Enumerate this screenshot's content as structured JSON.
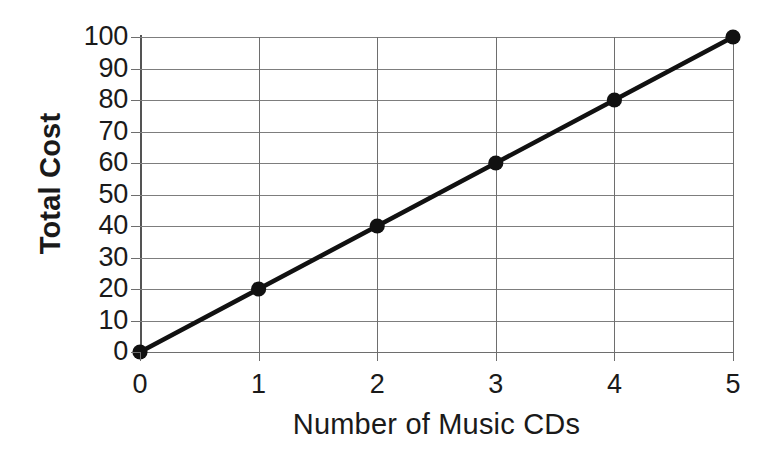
{
  "chart_data": {
    "type": "line",
    "title": "",
    "subtitle": "",
    "xlabel": "Number of Music CDs",
    "ylabel": "Total Cost",
    "x": [
      0,
      1,
      2,
      3,
      4,
      5
    ],
    "values": [
      0,
      20,
      40,
      60,
      80,
      100
    ],
    "series": [
      {
        "name": "Total Cost",
        "x": [
          0,
          1,
          2,
          3,
          4,
          5
        ],
        "values": [
          0,
          20,
          40,
          60,
          80,
          100
        ],
        "color": "#111111",
        "marker": "filled-circle"
      }
    ],
    "xlim": [
      0,
      5
    ],
    "ylim": [
      0,
      100
    ],
    "xticks": [
      0,
      1,
      2,
      3,
      4,
      5
    ],
    "yticks": [
      0,
      10,
      20,
      30,
      40,
      50,
      60,
      70,
      80,
      90,
      100
    ],
    "xtick_labels": [
      "0",
      "1",
      "2",
      "3",
      "4",
      "5"
    ],
    "ytick_labels": [
      "0",
      "10",
      "20",
      "30",
      "40",
      "50",
      "60",
      "70",
      "80",
      "90",
      "100"
    ],
    "grid": true,
    "grid_axes": "both",
    "legend": false,
    "legend_position": "none",
    "annotations": [],
    "colors": {
      "background": "#ffffff",
      "grid": "#7d7d7d",
      "axis": "#6e6e6e",
      "line": "#111111",
      "marker": "#111111",
      "text": "#1a1a1a"
    }
  }
}
